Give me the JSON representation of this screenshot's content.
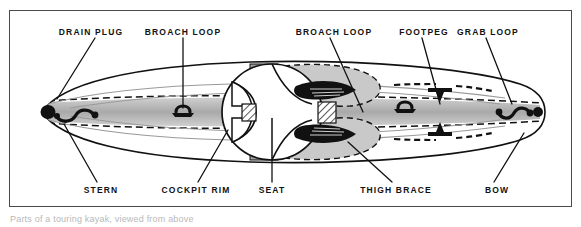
{
  "figure": {
    "caption_partial": "Parts of a touring kayak, viewed from above",
    "frame_color": "#4a4a4a",
    "ink_color": "#111111",
    "fill_gray": "#b5b5b5",
    "fill_light": "#d8d8d8",
    "background": "#ffffff"
  },
  "labels": {
    "top": [
      {
        "text": "DRAIN PLUG",
        "x": 91,
        "leader_to_x": 57,
        "leader_to_y": 99
      },
      {
        "text": "BROACH LOOP",
        "x": 183,
        "leader_to_x": 183,
        "leader_to_y": 108
      },
      {
        "text": "BROACH LOOP",
        "x": 334,
        "leader_to_x": 363,
        "leader_to_y": 112
      },
      {
        "text": "FOOTPEG",
        "x": 424,
        "leader_to_x": 440,
        "leader_to_y": 106
      },
      {
        "text": "GRAB LOOP",
        "x": 488,
        "leader_to_x": 512,
        "leader_to_y": 105
      }
    ],
    "bottom": [
      {
        "text": "STERN",
        "x": 101,
        "leader_to_x": 64,
        "leader_to_y": 124
      },
      {
        "text": "COCKPIT RIM",
        "x": 196,
        "leader_to_x": 228,
        "leader_to_y": 130
      },
      {
        "text": "SEAT",
        "x": 272,
        "leader_to_x": 272,
        "leader_to_y": 120
      },
      {
        "text": "THIGH BRACE",
        "x": 396,
        "leader_to_x": 348,
        "leader_to_y": 143
      },
      {
        "text": "BOW",
        "x": 497,
        "leader_to_x": 522,
        "leader_to_y": 133
      }
    ]
  }
}
